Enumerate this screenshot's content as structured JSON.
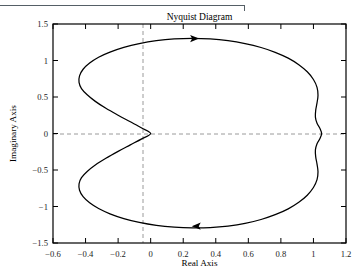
{
  "figure": {
    "title": "Nyquist Diagram",
    "page_rule_icon": "horizontal-rule-artifact"
  },
  "chart_data": {
    "type": "line",
    "title": "Nyquist Diagram",
    "xlabel": "Real Axis",
    "ylabel": "Imaginary Axis",
    "xlim": [
      -0.6,
      1.2
    ],
    "ylim": [
      -1.5,
      1.5
    ],
    "grid": false,
    "zero_lines": true,
    "legend": "none",
    "line_color": "#000000",
    "zero_line_color": "#9a9a9a",
    "axis_color": "#000000",
    "xticks": [
      "-0.6",
      "-0.4",
      "-0.2",
      "0",
      "0.2",
      "0.4",
      "0.6",
      "0.8",
      "1",
      "1.2"
    ],
    "xtick_values": [
      -0.6,
      -0.4,
      -0.2,
      0,
      0.2,
      0.4,
      0.6,
      0.8,
      1,
      1.2
    ],
    "yticks": [
      "1.5",
      "1",
      "0.5",
      "0",
      "-0.5",
      "-1",
      "-1.5"
    ],
    "ytick_values": [
      1.5,
      1,
      0.5,
      0,
      -0.5,
      -1,
      -1.5
    ],
    "annotations": [
      {
        "name": "direction-arrow-upper",
        "x": 0.27,
        "y": 1.3,
        "direction": "right"
      },
      {
        "name": "direction-arrow-lower",
        "x": 0.28,
        "y": -1.27,
        "direction": "left"
      }
    ],
    "series": [
      {
        "name": "Nyquist contour",
        "closed": true,
        "points": [
          [
            0.0,
            0.0
          ],
          [
            -0.055,
            0.075
          ],
          [
            -0.125,
            0.16
          ],
          [
            -0.2,
            0.25
          ],
          [
            -0.275,
            0.345
          ],
          [
            -0.34,
            0.44
          ],
          [
            -0.39,
            0.53
          ],
          [
            -0.425,
            0.615
          ],
          [
            -0.44,
            0.7
          ],
          [
            -0.437,
            0.79
          ],
          [
            -0.415,
            0.88
          ],
          [
            -0.375,
            0.965
          ],
          [
            -0.32,
            1.045
          ],
          [
            -0.25,
            1.115
          ],
          [
            -0.165,
            1.18
          ],
          [
            -0.07,
            1.232
          ],
          [
            0.035,
            1.272
          ],
          [
            0.145,
            1.296
          ],
          [
            0.255,
            1.304
          ],
          [
            0.365,
            1.296
          ],
          [
            0.475,
            1.272
          ],
          [
            0.58,
            1.232
          ],
          [
            0.678,
            1.178
          ],
          [
            0.765,
            1.112
          ],
          [
            0.845,
            1.032
          ],
          [
            0.91,
            0.942
          ],
          [
            0.962,
            0.845
          ],
          [
            1.0,
            0.74
          ],
          [
            1.022,
            0.632
          ],
          [
            1.028,
            0.525
          ],
          [
            1.022,
            0.42
          ],
          [
            1.014,
            0.32
          ],
          [
            1.012,
            0.225
          ],
          [
            1.022,
            0.14
          ],
          [
            1.04,
            0.068
          ],
          [
            1.05,
            0.0
          ],
          [
            1.04,
            -0.068
          ],
          [
            1.022,
            -0.14
          ],
          [
            1.012,
            -0.225
          ],
          [
            1.014,
            -0.32
          ],
          [
            1.022,
            -0.42
          ],
          [
            1.028,
            -0.525
          ],
          [
            1.022,
            -0.632
          ],
          [
            1.0,
            -0.74
          ],
          [
            0.962,
            -0.845
          ],
          [
            0.91,
            -0.942
          ],
          [
            0.845,
            -1.032
          ],
          [
            0.765,
            -1.112
          ],
          [
            0.678,
            -1.178
          ],
          [
            0.58,
            -1.232
          ],
          [
            0.475,
            -1.268
          ],
          [
            0.365,
            -1.288
          ],
          [
            0.255,
            -1.292
          ],
          [
            0.145,
            -1.282
          ],
          [
            0.035,
            -1.258
          ],
          [
            -0.07,
            -1.218
          ],
          [
            -0.165,
            -1.165
          ],
          [
            -0.25,
            -1.1
          ],
          [
            -0.32,
            -1.028
          ],
          [
            -0.375,
            -0.95
          ],
          [
            -0.415,
            -0.866
          ],
          [
            -0.437,
            -0.778
          ],
          [
            -0.44,
            -0.69
          ],
          [
            -0.425,
            -0.605
          ],
          [
            -0.39,
            -0.52
          ],
          [
            -0.34,
            -0.432
          ],
          [
            -0.275,
            -0.34
          ],
          [
            -0.2,
            -0.245
          ],
          [
            -0.125,
            -0.156
          ],
          [
            -0.055,
            -0.073
          ],
          [
            0.0,
            0.0
          ]
        ]
      }
    ]
  }
}
